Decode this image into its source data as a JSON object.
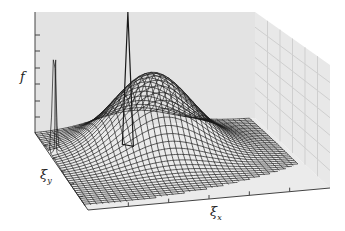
{
  "chart_data": {
    "type": "surface3d",
    "title": "",
    "axes": {
      "z": {
        "label": "f",
        "ticks": 6
      },
      "y": {
        "label": "ξ",
        "subscript": "y",
        "ticks": 5
      },
      "x": {
        "label": "ξ",
        "subscript": "x",
        "ticks": 5
      }
    },
    "surface": {
      "description": "Wireframe surface: broad Gaussian bump plus a very narrow tall spike near the back-left",
      "grid_resolution": 40,
      "components": [
        {
          "kind": "gaussian",
          "center": [
            0.45,
            0.3
          ],
          "sigma": 0.17,
          "amplitude": 0.62
        },
        {
          "kind": "spike",
          "center": [
            0.02,
            0.28
          ],
          "sigma": 0.008,
          "amplitude": 1.0
        }
      ],
      "domain": "quarter-disc footprint in the (ξx, ξy) plane"
    },
    "grid": {
      "back_wall": true,
      "right_wall": true
    },
    "colors": {
      "wall": "#e3e3e3",
      "floor": "#ebebeb",
      "axis_line": "#444444",
      "mesh": "#1a1a1a",
      "wall_grid": "#cfcfcf"
    }
  }
}
